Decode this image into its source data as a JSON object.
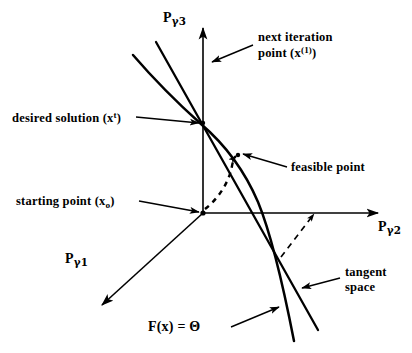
{
  "figure": {
    "background_color": "#ffffff",
    "ink_color": "#000000",
    "width": 412,
    "height": 353
  },
  "axes": {
    "vertical": {
      "base": "P",
      "subscript": "γ3",
      "label": "Pγ3"
    },
    "horizontal": {
      "base": "P",
      "subscript": "γ2",
      "label": "Pγ2"
    },
    "depth": {
      "base": "P",
      "subscript": "γ1",
      "label": "Pγ1"
    }
  },
  "annotations": {
    "next_iteration": {
      "line1": "next iteration",
      "line2_pre": "point (x",
      "line2_sup": "(1)",
      "line2_post": ")"
    },
    "desired_solution": {
      "pre": "desired solution (x",
      "sup": "t",
      "post": ")"
    },
    "starting_point": {
      "pre": "starting point (x",
      "sub": "o",
      "post": ")"
    },
    "feasible_point": {
      "text": "feasible point"
    },
    "tangent_space": {
      "line1": "tangent",
      "line2": "space"
    },
    "equation": {
      "text": "F(x) = Θ",
      "lhs": "F(x)",
      "eq": "=",
      "rhs": "Θ"
    }
  },
  "markers": {
    "desired_solution_point": {
      "x": 203,
      "y": 123
    },
    "next_iteration_point": {
      "x": 203,
      "y": 62
    },
    "starting_point": {
      "x": 203,
      "y": 213
    },
    "feasible_point": {
      "x": 238,
      "y": 155
    }
  },
  "curves": {
    "constraint_curve_name": "F(x) = Θ",
    "tangent_line_name": "tangent space",
    "iteration_path_name": "dashed iteration arc",
    "projection_name": "dashed projection arrow"
  }
}
